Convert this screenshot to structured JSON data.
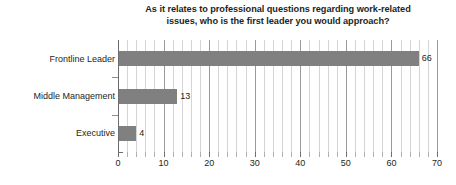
{
  "chart_data": {
    "type": "bar",
    "orientation": "horizontal",
    "title": "As it relates to professional questions regarding work-related issues, who is the first leader you would approach?",
    "title_line1": "As it relates to professional questions regarding work-related",
    "title_line2": "issues, who is the first leader you would approach?",
    "categories": [
      "Frontline Leader",
      "Middle Management",
      "Executive"
    ],
    "values": [
      66,
      13,
      4
    ],
    "data_labels": [
      "66",
      "13",
      "4"
    ],
    "xlabel": "",
    "ylabel": "",
    "xlim": [
      0,
      70
    ],
    "xticks": [
      0,
      10,
      20,
      30,
      40,
      50,
      60,
      70
    ],
    "xtick_labels": [
      "0",
      "10",
      "20",
      "30",
      "40",
      "50",
      "60",
      "70"
    ],
    "minor_tick_step": 2,
    "grid": true,
    "legend": false,
    "bar_color": "#808080",
    "gridline_color": "#d5d5d5",
    "major_gridline_color": "#9a9a9a",
    "axis_color": "#6d6d6d",
    "text_color": "#231f20",
    "background": "#ffffff"
  }
}
